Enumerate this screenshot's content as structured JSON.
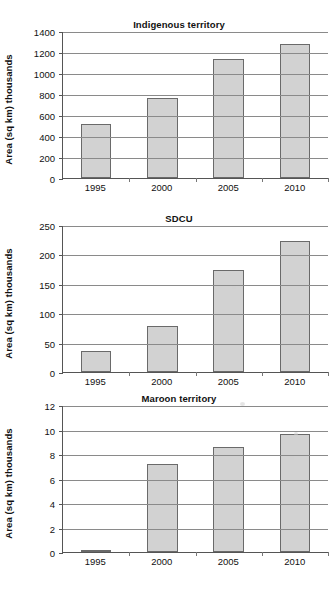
{
  "page": {
    "background_color": "#ffffff",
    "text_color": "#1a1a1a"
  },
  "style": {
    "bar_fill": "#d2d2d2",
    "bar_border": "#6a6a6a",
    "grid_color": "#8a8a8a",
    "axis_color": "#555555"
  },
  "chart_data": [
    {
      "type": "bar",
      "title": "Indigenous territory",
      "xlabel": "",
      "ylabel": "Area (sq km) thousands",
      "categories": [
        "1995",
        "2000",
        "2005",
        "2010"
      ],
      "values": [
        510,
        760,
        1130,
        1275
      ],
      "ylim": [
        0,
        1400
      ],
      "yticks": [
        0,
        200,
        400,
        600,
        800,
        1000,
        1200,
        1400
      ],
      "ytick_labels": [
        "0",
        "200",
        "400",
        "600",
        "800",
        "1000",
        "1200",
        "1400"
      ],
      "grid": true,
      "legend": "none"
    },
    {
      "type": "bar",
      "title": "SDCU",
      "xlabel": "",
      "ylabel": "Area (sq km) thousands",
      "categories": [
        "1995",
        "2000",
        "2005",
        "2010"
      ],
      "values": [
        35,
        79,
        173,
        223
      ],
      "ylim": [
        0,
        250
      ],
      "yticks": [
        0,
        50,
        100,
        150,
        200,
        250
      ],
      "ytick_labels": [
        "0",
        "50",
        "100",
        "150",
        "200",
        "250"
      ],
      "grid": true,
      "legend": "none"
    },
    {
      "type": "bar",
      "title": "Maroon territory",
      "xlabel": "",
      "ylabel": "Area (sq km) thousands",
      "categories": [
        "1995",
        "2000",
        "2005",
        "2010"
      ],
      "values": [
        0.05,
        7.2,
        8.6,
        9.6
      ],
      "ylim": [
        0,
        12
      ],
      "yticks": [
        0,
        2,
        4,
        6,
        8,
        10,
        12
      ],
      "ytick_labels": [
        "0",
        "2",
        "4",
        "6",
        "8",
        "10",
        "12"
      ],
      "grid": true,
      "legend": "none"
    }
  ]
}
